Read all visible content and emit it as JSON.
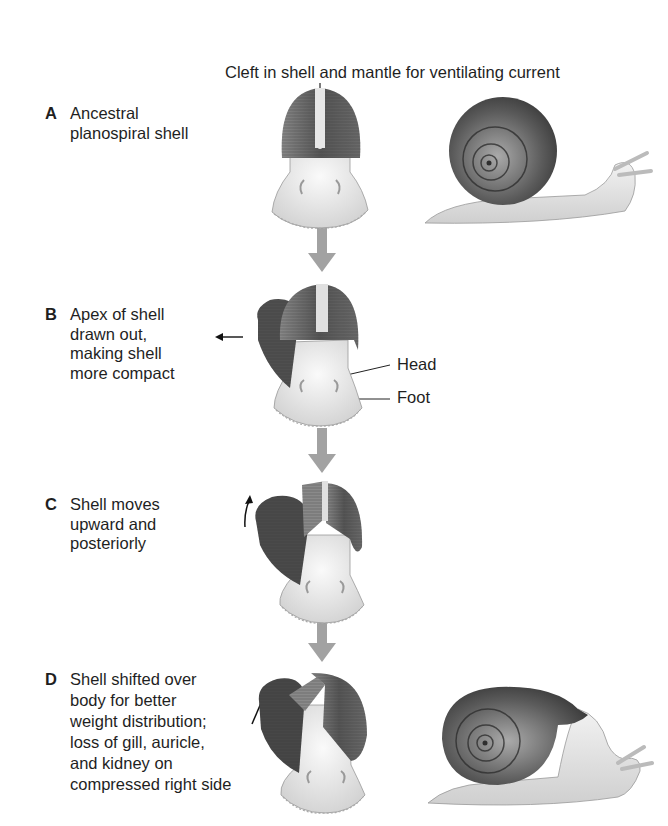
{
  "figure": {
    "top_callout": "Cleft in shell and mantle for ventilating current",
    "stages": [
      {
        "letter": "A",
        "lines": [
          "Ancestral",
          "planospiral shell"
        ]
      },
      {
        "letter": "B",
        "lines": [
          "Apex of shell",
          "drawn out,",
          "making shell",
          "more compact"
        ]
      },
      {
        "letter": "C",
        "lines": [
          "Shell moves",
          "upward and",
          "posteriorly"
        ]
      },
      {
        "letter": "D",
        "lines": [
          "Shell shifted over",
          "body for better",
          "weight distribution;",
          "loss of gill, auricle,",
          "and kidney on",
          "compressed right side"
        ]
      }
    ],
    "callouts": {
      "head": "Head",
      "foot": "Foot"
    },
    "colors": {
      "shell_dark": "#4a4a4a",
      "shell_mid": "#7a7a7a",
      "body_light": "#e6e6e6",
      "flow_arrow": "#a0a0a0",
      "text": "#1f1f1f"
    }
  }
}
